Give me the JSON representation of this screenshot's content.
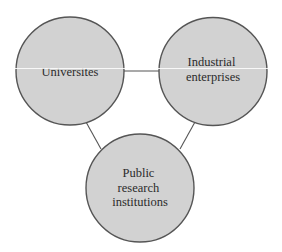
{
  "diagram": {
    "type": "triangle-network",
    "colors": {
      "node_fill": "#d2d2d2",
      "node_stroke": "#555555",
      "edge_stroke": "#555555",
      "text": "#2b2b2b",
      "background": "#ffffff"
    },
    "nodes": [
      {
        "id": "universities",
        "lines": [
          "Universites"
        ]
      },
      {
        "id": "industrial",
        "lines": [
          "Industrial",
          "enterprises"
        ]
      },
      {
        "id": "public",
        "lines": [
          "Public",
          "research",
          "institutions"
        ]
      }
    ],
    "edges": [
      {
        "from": "universities",
        "to": "industrial"
      },
      {
        "from": "universities",
        "to": "public"
      },
      {
        "from": "industrial",
        "to": "public"
      }
    ]
  }
}
